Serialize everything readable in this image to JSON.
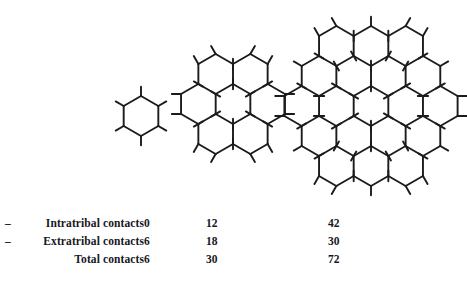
{
  "figure": {
    "stroke_color": "#1b1b1b",
    "background_color": "#ffffff",
    "clusters": [
      {
        "name": "benzene",
        "rings": 1,
        "center_x": 141,
        "center_y": 116,
        "ring_radius": 20,
        "intratribal_contacts": 0,
        "extratribal_contacts": 6,
        "total_contacts": 6
      },
      {
        "name": "coronene",
        "rings": 7,
        "center_x": 233,
        "center_y": 104,
        "ring_radius": 20,
        "intratribal_contacts": 12,
        "extratribal_contacts": 18,
        "total_contacts": 30
      },
      {
        "name": "circumcoronene",
        "rings": 19,
        "center_x": 371,
        "center_y": 106,
        "ring_radius": 20,
        "intratribal_contacts": 42,
        "extratribal_contacts": 30,
        "total_contacts": 72
      }
    ]
  },
  "legend": {
    "rows": [
      {
        "marker": "–",
        "label": "Intratribal contacts",
        "values": [
          "0",
          "12",
          "42"
        ]
      },
      {
        "marker": "–",
        "label": "Extratribal contacts",
        "values": [
          "6",
          "18",
          "30"
        ]
      },
      {
        "marker": "",
        "label": "Total contacts",
        "values": [
          "6",
          "30",
          "72"
        ]
      }
    ]
  },
  "chart_data": {
    "type": "table",
    "title": "",
    "categories": [
      "1 hexagon",
      "7 hexagons",
      "19 hexagons"
    ],
    "series": [
      {
        "name": "Intratribal contacts",
        "values": [
          0,
          12,
          42
        ]
      },
      {
        "name": "Extratribal contacts",
        "values": [
          6,
          18,
          30
        ]
      },
      {
        "name": "Total contacts",
        "values": [
          6,
          30,
          72
        ]
      }
    ],
    "xlabel": "",
    "ylabel": "",
    "grid": false,
    "legend_position": "left"
  }
}
